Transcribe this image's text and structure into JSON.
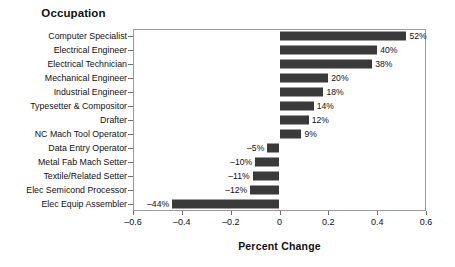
{
  "chart_data": {
    "type": "bar",
    "orientation": "horizontal",
    "title": "Occupation",
    "xlabel": "Percent Change",
    "ylabel": "Occupation",
    "grid": false,
    "legend": null,
    "xlim": [
      -0.6,
      0.6
    ],
    "xticks": [
      "-0.6",
      "-0.4",
      "-0.2",
      "0",
      "0.2",
      "0.4",
      "0.6"
    ],
    "xtick_values": [
      -0.6,
      -0.4,
      -0.2,
      0,
      0.2,
      0.4,
      0.6
    ],
    "categories": [
      "Computer Specialist",
      "Electrical Engineer",
      "Electrical Technician",
      "Mechanical Engineer",
      "Industrial Engineer",
      "Typesetter & Compositor",
      "Drafter",
      "NC Mach Tool Operator",
      "Data Entry Operator",
      "Metal Fab Mach Setter",
      "Textile/Related Setter",
      "Elec Semicond Processor",
      "Elec Equip Assembler"
    ],
    "values": [
      0.52,
      0.4,
      0.38,
      0.2,
      0.18,
      0.14,
      0.12,
      0.09,
      -0.05,
      -0.1,
      -0.11,
      -0.12,
      -0.44
    ],
    "data_labels": [
      "52%",
      "40%",
      "38%",
      "20%",
      "18%",
      "14%",
      "12%",
      "9%",
      "–5%",
      "–10%",
      "–11%",
      "–12%",
      "–44%"
    ],
    "bar_color": "#3a3a3a",
    "axis_color": "#9a9a9a",
    "background_color": "#ffffff"
  }
}
